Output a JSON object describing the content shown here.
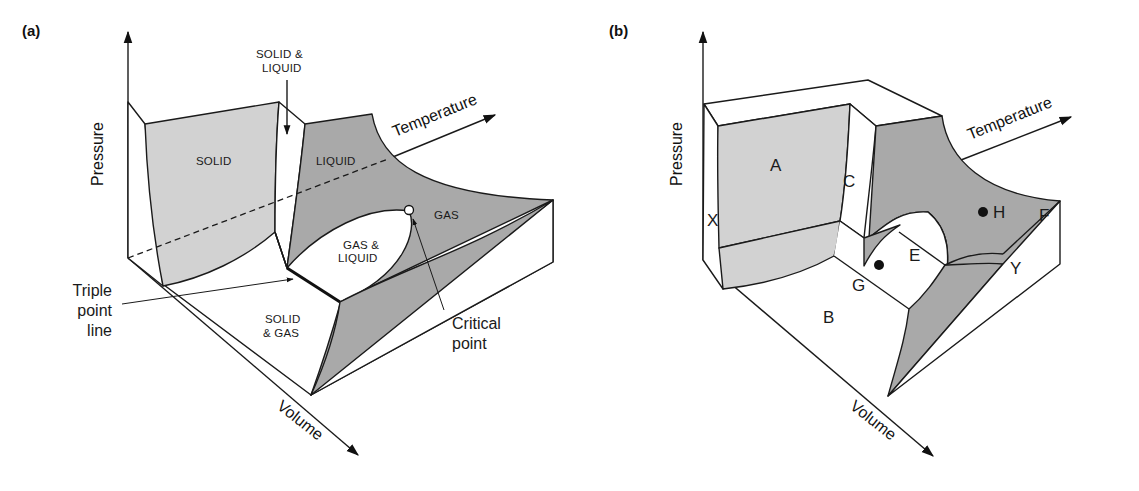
{
  "figure": {
    "panel_a": {
      "label": "(a)",
      "axes": {
        "pressure": "Pressure",
        "temperature": "Temperature",
        "volume": "Volume"
      },
      "regions": {
        "solid": "SOLID",
        "solid_liquid_1": "SOLID &",
        "solid_liquid_2": "LIQUID",
        "liquid": "LIQUID",
        "gas": "GAS",
        "gas_liquid_1": "GAS &",
        "gas_liquid_2": "LIQUID",
        "solid_gas_1": "SOLID",
        "solid_gas_2": "& GAS"
      },
      "callouts": {
        "triple_point_1": "Triple",
        "triple_point_2": "point",
        "triple_point_3": "line",
        "critical_point_1": "Critical",
        "critical_point_2": "point"
      }
    },
    "panel_b": {
      "label": "(b)",
      "axes": {
        "pressure": "Pressure",
        "temperature": "Temperature",
        "volume": "Volume"
      },
      "regions": {
        "A": "A",
        "B": "B",
        "C": "C",
        "E": "E",
        "F": "F",
        "G": "G",
        "H": "H",
        "X": "X",
        "Y": "Y"
      }
    },
    "colors": {
      "solid_surface": "#d2d2d2",
      "liquid_surface": "#a9a9a9",
      "lines": "#1a1a1a",
      "background": "#ffffff"
    }
  }
}
